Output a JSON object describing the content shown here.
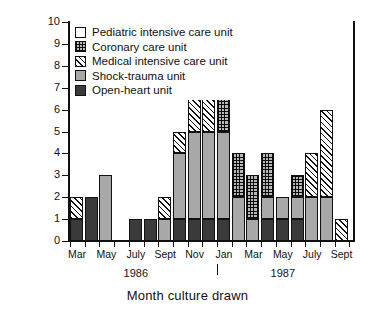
{
  "chart_data": {
    "type": "bar",
    "subtype": "stacked-bar",
    "title": "",
    "xlabel": "Month culture drawn",
    "ylabel": "Cases",
    "ylim": [
      0,
      10
    ],
    "ytick_values": [
      0,
      1,
      2,
      3,
      4,
      5,
      6,
      7,
      8,
      9,
      10
    ],
    "ytick_labels": [
      "0",
      "1",
      "2",
      "3",
      "4",
      "5",
      "6",
      "7",
      "8",
      "9",
      "10"
    ],
    "grid": false,
    "legend_position": "upper-left-inside",
    "x": [
      "Mar 1986",
      "Apr 1986",
      "May 1986",
      "June 1986",
      "July 1986",
      "Aug 1986",
      "Sept 1986",
      "Oct 1986",
      "Nov 1986",
      "Dec 1986",
      "Jan 1987",
      "Feb 1987",
      "Mar 1987",
      "Apr 1987",
      "May 1987",
      "June 1987",
      "July 1987",
      "Aug 1987",
      "Sept 1987"
    ],
    "categories": [
      "Mar",
      "Apr",
      "May",
      "June",
      "July",
      "Aug",
      "Sept",
      "Oct",
      "Nov",
      "Dec",
      "Jan",
      "Feb",
      "Mar",
      "Apr",
      "May",
      "June",
      "July",
      "Aug",
      "Sept"
    ],
    "xtick_labels_shown": [
      "Mar",
      "",
      "May",
      "",
      "July",
      "",
      "Sept",
      "",
      "Nov",
      "",
      "Jan",
      "",
      "Mar",
      "",
      "May",
      "",
      "July",
      "",
      "Sept"
    ],
    "year_annotations": [
      {
        "label": "1986",
        "at_category": "July"
      },
      {
        "label": "1987",
        "at_category": "May"
      }
    ],
    "year_divider_at_category": "Jan",
    "series": [
      {
        "name": "Open-heart unit",
        "key": "openheart",
        "values": [
          1,
          2,
          0,
          0,
          1,
          1,
          0,
          1,
          1,
          1,
          1,
          0,
          0,
          1,
          1,
          1,
          0,
          0,
          0
        ]
      },
      {
        "name": "Shock-trauma unit",
        "key": "shock",
        "values": [
          0,
          0,
          3,
          0,
          0,
          0,
          1,
          3,
          4,
          4,
          4,
          2,
          1,
          1,
          1,
          1,
          2,
          2,
          0
        ]
      },
      {
        "name": "Medical intensive care unit",
        "key": "medical",
        "values": [
          1,
          0,
          0,
          0,
          0,
          0,
          1,
          1,
          2,
          2,
          0,
          0,
          0,
          0,
          0,
          0,
          2,
          4,
          1
        ]
      },
      {
        "name": "Coronary care unit",
        "key": "coronary",
        "values": [
          0,
          0,
          0,
          0,
          0,
          0,
          0,
          0,
          0,
          0,
          2,
          2,
          2,
          2,
          0,
          1,
          0,
          0,
          0
        ]
      },
      {
        "name": "Pediatric intensive care unit",
        "key": "pediatric",
        "values": [
          0,
          0,
          0,
          0,
          0,
          0,
          0,
          0,
          1,
          0,
          0,
          0,
          0,
          0,
          0,
          0,
          0,
          0,
          0
        ]
      }
    ],
    "totals": [
      2,
      2,
      3,
      0,
      1,
      1,
      2,
      5,
      8,
      7,
      7,
      4,
      3,
      4,
      2,
      3,
      4,
      6,
      1
    ],
    "colors": {
      "pediatric": "#ffffff",
      "coronary": "#d9d9d9",
      "medical": "#ffffff",
      "shock": "#a8a8a8",
      "openheart": "#3a3a3a",
      "outline": "#111111"
    }
  },
  "legend": {
    "items": [
      {
        "label": "Pediatric intensive care unit",
        "key": "pediatric"
      },
      {
        "label": "Coronary care unit",
        "key": "coronary"
      },
      {
        "label": "Medical intensive care unit",
        "key": "medical"
      },
      {
        "label": "Shock-trauma unit",
        "key": "shock"
      },
      {
        "label": "Open-heart unit",
        "key": "openheart"
      }
    ]
  }
}
